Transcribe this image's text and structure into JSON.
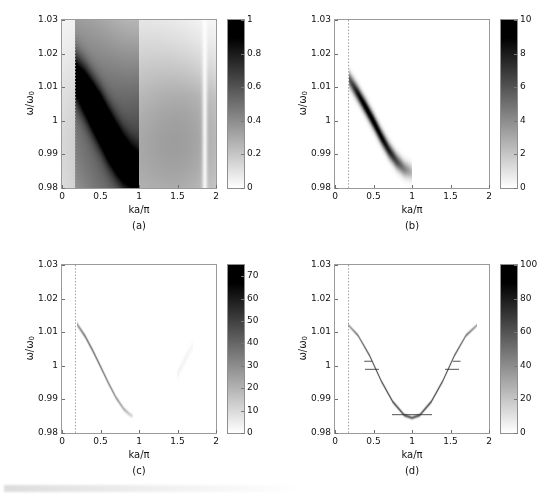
{
  "figure": {
    "layout": "2x2 grid of spectral-function density maps",
    "background": "#ffffff"
  },
  "axes_common": {
    "xlabel": "ka/π",
    "ylabel_main": "ω/ω",
    "ylabel_sub": "0",
    "xticks": [
      "0",
      "0.5",
      "1",
      "1.5",
      "2"
    ],
    "xtick_values": [
      0,
      0.5,
      1,
      1.5,
      2
    ],
    "yticks": [
      "1.03",
      "1.02",
      "1.01",
      "1",
      "0.99",
      "0.98"
    ],
    "ytick_values": [
      1.03,
      1.02,
      1.01,
      1.0,
      0.99,
      0.98
    ],
    "xlim": [
      0,
      2
    ],
    "ylim": [
      0.98,
      1.03
    ],
    "marker_line_x": 0.17,
    "marker_line_style": "dotted",
    "marker_line_color": "#9b9b9b"
  },
  "panels": [
    {
      "id": "a",
      "caption": "(a)",
      "colorbar": {
        "ticks": [
          "0",
          "0.2",
          "0.4",
          "0.6",
          "0.8",
          "1"
        ],
        "tick_values": [
          0,
          0.2,
          0.4,
          0.6,
          0.8,
          1
        ],
        "vmin": 0,
        "vmax": 1,
        "colormap": "gray-inverted"
      },
      "chart_data": {
        "type": "heatmap",
        "title": "(a)",
        "xlabel": "ka/π",
        "ylabel": "ω/ω0",
        "xlim": [
          0,
          2
        ],
        "ylim": [
          0.98,
          1.03
        ],
        "zlim": [
          0,
          1
        ],
        "grid": false,
        "description": "Broad, heavily damped spectral band descending from (0.17, 1.013) to (0.95, 0.9855); strong diffuse background weight fills the whole panel, brightest (white) near the top-right corner and along a vertical stripe at ka/π ≈ 1.85.",
        "band_width_sigma": 0.0052,
        "band_peak_amplitude": 1.0,
        "background_level": 0.2,
        "ridge_points": [
          {
            "x": 0.17,
            "y": 1.013,
            "z": 0.62
          },
          {
            "x": 0.3,
            "y": 1.0085,
            "z": 0.82
          },
          {
            "x": 0.4,
            "y": 1.0045,
            "z": 0.93
          },
          {
            "x": 0.5,
            "y": 1.0005,
            "z": 1.0
          },
          {
            "x": 0.6,
            "y": 0.996,
            "z": 0.97
          },
          {
            "x": 0.7,
            "y": 0.992,
            "z": 0.88
          },
          {
            "x": 0.8,
            "y": 0.9885,
            "z": 0.74
          },
          {
            "x": 0.9,
            "y": 0.9862,
            "z": 0.58
          },
          {
            "x": 1.0,
            "y": 0.985,
            "z": 0.44
          }
        ]
      }
    },
    {
      "id": "b",
      "caption": "(b)",
      "colorbar": {
        "ticks": [
          "0",
          "2",
          "4",
          "6",
          "8",
          "10"
        ],
        "tick_values": [
          0,
          2,
          4,
          6,
          8,
          10
        ],
        "vmin": 0,
        "vmax": 10,
        "colormap": "gray-inverted"
      },
      "chart_data": {
        "type": "heatmap",
        "title": "(b)",
        "xlabel": "ka/π",
        "ylabel": "ω/ω0",
        "xlim": [
          0,
          2
        ],
        "ylim": [
          0.98,
          1.03
        ],
        "zlim": [
          0,
          10
        ],
        "grid": false,
        "description": "Moderately sharp spectral band from (0.18, 1.0125) curving down to (1.0, 0.9845); white elsewhere except a faint trace near ka/π ≈ 1.65.",
        "band_width_sigma": 0.0016,
        "band_peak_amplitude": 9.5,
        "background_level": 0.0,
        "ridge_points": [
          {
            "x": 0.18,
            "y": 1.0125,
            "z": 5.5
          },
          {
            "x": 0.3,
            "y": 1.008,
            "z": 8.5
          },
          {
            "x": 0.4,
            "y": 1.004,
            "z": 9.5
          },
          {
            "x": 0.5,
            "y": 0.9998,
            "z": 9.5
          },
          {
            "x": 0.6,
            "y": 0.9953,
            "z": 9.0
          },
          {
            "x": 0.7,
            "y": 0.9912,
            "z": 8.0
          },
          {
            "x": 0.8,
            "y": 0.988,
            "z": 6.5
          },
          {
            "x": 0.9,
            "y": 0.9857,
            "z": 4.5
          },
          {
            "x": 1.0,
            "y": 0.9847,
            "z": 2.5
          }
        ]
      }
    },
    {
      "id": "c",
      "caption": "(c)",
      "colorbar": {
        "ticks": [
          "0",
          "10",
          "20",
          "30",
          "40",
          "50",
          "60",
          "70"
        ],
        "tick_values": [
          0,
          10,
          20,
          30,
          40,
          50,
          60,
          70
        ],
        "vmin": 0,
        "vmax": 75,
        "colormap": "gray-inverted"
      },
      "chart_data": {
        "type": "heatmap",
        "title": "(c)",
        "xlabel": "ka/π",
        "ylabel": "ω/ω0",
        "xlim": [
          0,
          2
        ],
        "ylim": [
          0.98,
          1.03
        ],
        "zlim": [
          0,
          75
        ],
        "grid": false,
        "description": "Very narrow, faint quasiparticle line from (0.20, 1.0122) to (0.90, 0.9852); an extremely faint secondary branch appears near ka/π = 1.5-1.7.",
        "band_width_sigma": 0.00045,
        "band_peak_amplitude": 34,
        "background_level": 0.0,
        "ridge_points": [
          {
            "x": 0.2,
            "y": 1.0122,
            "z": 26
          },
          {
            "x": 0.3,
            "y": 1.0088,
            "z": 33
          },
          {
            "x": 0.4,
            "y": 1.0045,
            "z": 34
          },
          {
            "x": 0.5,
            "y": 0.9998,
            "z": 33
          },
          {
            "x": 0.6,
            "y": 0.995,
            "z": 30
          },
          {
            "x": 0.7,
            "y": 0.9906,
            "z": 26
          },
          {
            "x": 0.8,
            "y": 0.9872,
            "z": 20
          },
          {
            "x": 0.88,
            "y": 0.9855,
            "z": 13
          },
          {
            "x": 0.92,
            "y": 0.9851,
            "z": 7
          }
        ],
        "secondary_branch": [
          {
            "x": 1.5,
            "y": 0.9975,
            "z": 3
          },
          {
            "x": 1.6,
            "y": 1.002,
            "z": 3
          },
          {
            "x": 1.7,
            "y": 1.0062,
            "z": 2
          }
        ]
      }
    },
    {
      "id": "d",
      "caption": "(d)",
      "colorbar": {
        "ticks": [
          "0",
          "20",
          "40",
          "60",
          "80",
          "100"
        ],
        "tick_values": [
          0,
          20,
          40,
          60,
          80,
          100
        ],
        "vmin": 0,
        "vmax": 100,
        "colormap": "gray-inverted"
      },
      "chart_data": {
        "type": "heatmap",
        "title": "(d)",
        "xlabel": "ka/π",
        "ylabel": "ω/ω0",
        "xlim": [
          0,
          2
        ],
        "ylim": [
          0.98,
          1.03
        ],
        "zlim": [
          0,
          100
        ],
        "grid": false,
        "description": "Sharp symmetric cosine-like dispersion spanning ka/π = 0.17 to 1.85, minimum ω/ω0 ≈ 0.9845 at ka/π = 1, endpoints at ω/ω0 ≈ 1.0122. Short horizontal whisker segments cross the curve at several k points.",
        "band_width_sigma": 0.00035,
        "band_peak_amplitude": 60,
        "background_level": 0.0,
        "ridge_points": [
          {
            "x": 0.17,
            "y": 1.0122,
            "z": 30
          },
          {
            "x": 0.3,
            "y": 1.009,
            "z": 45
          },
          {
            "x": 0.45,
            "y": 1.003,
            "z": 55
          },
          {
            "x": 0.6,
            "y": 0.9955,
            "z": 58
          },
          {
            "x": 0.75,
            "y": 0.9893,
            "z": 58
          },
          {
            "x": 0.9,
            "y": 0.9853,
            "z": 55
          },
          {
            "x": 1.0,
            "y": 0.9845,
            "z": 52
          },
          {
            "x": 1.1,
            "y": 0.9853,
            "z": 55
          },
          {
            "x": 1.25,
            "y": 0.9893,
            "z": 58
          },
          {
            "x": 1.4,
            "y": 0.9955,
            "z": 58
          },
          {
            "x": 1.55,
            "y": 1.003,
            "z": 55
          },
          {
            "x": 1.7,
            "y": 1.009,
            "z": 45
          },
          {
            "x": 1.85,
            "y": 1.0122,
            "z": 30
          }
        ],
        "whiskers": [
          {
            "x": 0.48,
            "y": 0.9991,
            "halfwidth": 0.09
          },
          {
            "x": 0.43,
            "y": 1.0015,
            "halfwidth": 0.05
          },
          {
            "x": 1.0,
            "y": 0.9856,
            "halfwidth": 0.26
          },
          {
            "x": 1.52,
            "y": 0.9991,
            "halfwidth": 0.09
          },
          {
            "x": 1.58,
            "y": 1.0015,
            "halfwidth": 0.05
          }
        ]
      }
    }
  ]
}
